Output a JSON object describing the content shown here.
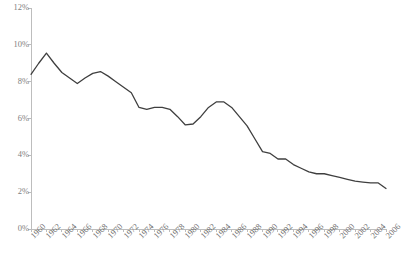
{
  "chart_data": {
    "type": "line",
    "title": "",
    "subtitle": "",
    "xlabel": "",
    "ylabel": "",
    "xlim": [
      1960,
      2006
    ],
    "ylim": [
      0,
      12
    ],
    "grid": false,
    "legend": "none",
    "y_tick_labels": [
      "12%",
      "10%",
      "8%",
      "6%",
      "4%",
      "2%",
      "0%"
    ],
    "y_tick_values": [
      12,
      10,
      8,
      6,
      4,
      2,
      0
    ],
    "x_tick_labels": [
      "1960",
      "1962",
      "1964",
      "1966",
      "1968",
      "1970",
      "1972",
      "1974",
      "1976",
      "1978",
      "1980",
      "1982",
      "1984",
      "1986",
      "1988",
      "1990",
      "1992",
      "1994",
      "1996",
      "1998",
      "2000",
      "2002",
      "2004",
      "2006"
    ],
    "x": [
      1960,
      1961,
      1962,
      1963,
      1964,
      1965,
      1966,
      1967,
      1968,
      1969,
      1970,
      1971,
      1972,
      1973,
      1974,
      1975,
      1976,
      1977,
      1978,
      1979,
      1980,
      1981,
      1982,
      1983,
      1984,
      1985,
      1986,
      1987,
      1988,
      1989,
      1990,
      1991,
      1992,
      1993,
      1994,
      1995,
      1996,
      1997,
      1998,
      1999,
      2000,
      2001,
      2002,
      2003,
      2004,
      2005,
      2006
    ],
    "values": [
      8.4,
      9.0,
      9.55,
      9.0,
      8.5,
      8.2,
      7.9,
      8.2,
      8.45,
      8.55,
      8.3,
      8.0,
      7.7,
      7.4,
      6.6,
      6.5,
      6.6,
      6.6,
      6.5,
      6.1,
      5.65,
      5.7,
      6.1,
      6.6,
      6.9,
      6.9,
      6.6,
      6.1,
      5.6,
      4.9,
      4.2,
      4.1,
      3.8,
      3.8,
      3.5,
      3.3,
      3.1,
      3.0,
      3.0,
      2.9,
      2.8,
      2.7,
      2.6,
      2.55,
      2.5,
      2.5,
      2.2
    ],
    "series": [
      {
        "name": "",
        "color": "#3f3f3f",
        "values": [
          8.4,
          9.0,
          9.55,
          9.0,
          8.5,
          8.2,
          7.9,
          8.2,
          8.45,
          8.55,
          8.3,
          8.0,
          7.7,
          7.4,
          6.6,
          6.5,
          6.6,
          6.6,
          6.5,
          6.1,
          5.65,
          5.7,
          6.1,
          6.6,
          6.9,
          6.9,
          6.6,
          6.1,
          5.6,
          4.9,
          4.2,
          4.1,
          3.8,
          3.8,
          3.5,
          3.3,
          3.1,
          3.0,
          3.0,
          2.9,
          2.8,
          2.7,
          2.6,
          2.55,
          2.5,
          2.5,
          2.2
        ]
      }
    ],
    "colors": {
      "line": "#3f3f3f",
      "axis": "#bdbdbd",
      "tick_label": "#808080",
      "background": "#ffffff"
    }
  },
  "axes": {
    "plot_left_px": 31,
    "plot_right_px": 386,
    "plot_top_px": 8,
    "plot_bottom_px": 229
  }
}
